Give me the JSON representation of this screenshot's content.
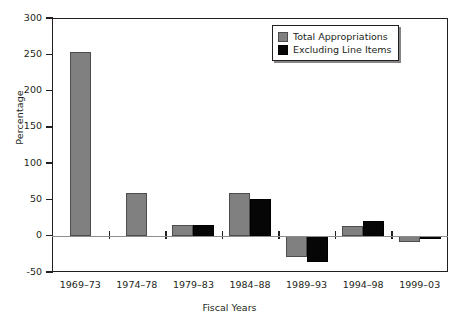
{
  "chart_data": {
    "type": "bar",
    "title": "",
    "xlabel": "Fiscal Years",
    "ylabel": "Percentage",
    "categories": [
      "1969–73",
      "1974–78",
      "1979–83",
      "1984–88",
      "1989–93",
      "1994–98",
      "1999–03"
    ],
    "series": [
      {
        "name": "Total Appropriations",
        "color": "#808080",
        "values": [
          253,
          59,
          15,
          59,
          -30,
          14,
          -8
        ]
      },
      {
        "name": "Excluding Line Items",
        "color": "#060606",
        "values": [
          null,
          null,
          15,
          50,
          -36,
          20,
          -5
        ]
      }
    ],
    "ylim": [
      -50,
      300
    ],
    "yticks": [
      -50,
      0,
      50,
      100,
      150,
      200,
      250,
      300
    ],
    "ytick_labels": [
      "-50",
      "0",
      "50",
      "100",
      "150",
      "200",
      "250",
      "300"
    ],
    "grid": false,
    "legend_position": "top-right"
  },
  "legend": {
    "entries": [
      {
        "label": "Total Appropriations",
        "swatch": "total"
      },
      {
        "label": "Excluding Line Items",
        "swatch": "excluding"
      }
    ]
  }
}
